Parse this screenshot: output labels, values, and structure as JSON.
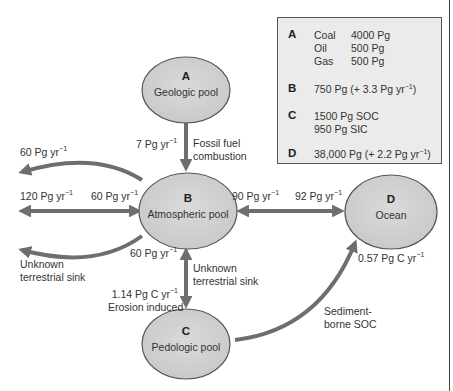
{
  "pools": {
    "A": {
      "letter": "A",
      "name": "Geologic pool"
    },
    "B": {
      "letter": "B",
      "name": "Atmospheric pool"
    },
    "C": {
      "letter": "C",
      "name": "Pedologic pool"
    },
    "D": {
      "letter": "D",
      "name": "Ocean"
    }
  },
  "flows": {
    "fossil_rate": "7 Pg yr",
    "fossil_label_1": "Fossil fuel",
    "fossil_label_2": "combustion",
    "left_top_rate": "60 Pg yr",
    "left_mid_rate_outer": "120 Pg yr",
    "left_mid_rate_inner": "60 Pg yr",
    "left_sink_1": "Unknown",
    "left_sink_2": "terrestrial sink",
    "b_to_d_rate": "90 Pg yr",
    "d_to_b_rate": "92 Pg yr",
    "c_to_b_rate": "60 Pg yr",
    "mid_sink_1": "Unknown",
    "mid_sink_2": "terrestrial sink",
    "erosion_rate": "1.14 Pg C yr",
    "erosion_label": "Erosion induced",
    "ocean_rate": "0.57 Pg C yr",
    "sediment_1": "Sediment-",
    "sediment_2": "borne SOC",
    "exponent": "−1"
  },
  "legend": {
    "A": {
      "key": "A",
      "rows": [
        {
          "name": "Coal",
          "value": "4000 Pg"
        },
        {
          "name": "Oil",
          "value": "500 Pg"
        },
        {
          "name": "Gas",
          "value": "500 Pg"
        }
      ]
    },
    "B": {
      "key": "B",
      "text": "750 Pg (+ 3.3 Pg yr",
      "close": ")"
    },
    "C": {
      "key": "C",
      "line1": "1500 Pg SOC",
      "line2": "950 Pg SIC"
    },
    "D": {
      "key": "D",
      "text": "38,000 Pg (+ 2.2 Pg yr",
      "close": ")"
    }
  },
  "colors": {
    "pool_fill": "#d2d2d2",
    "pool_stroke": "#555555",
    "arrow": "#6e6e6e",
    "legend_bg": "#ebebeb"
  }
}
